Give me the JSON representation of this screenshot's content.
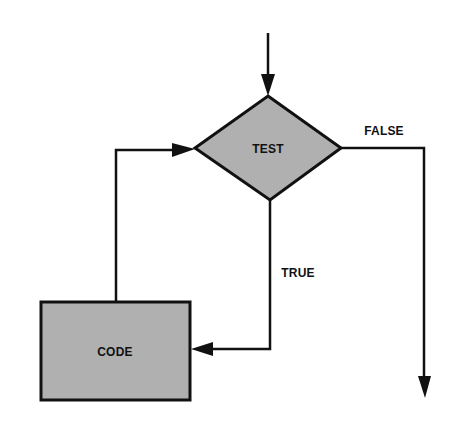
{
  "diagram": {
    "type": "flowchart-while-loop",
    "colors": {
      "background": "#ffffff",
      "stroke": "#111111",
      "shape_fill": "#b0b0b0"
    },
    "nodes": {
      "test": {
        "label": "TEST",
        "shape": "diamond"
      },
      "code": {
        "label": "CODE",
        "shape": "rectangle"
      }
    },
    "edges": {
      "true_label": "TRUE",
      "false_label": "FALSE"
    }
  }
}
